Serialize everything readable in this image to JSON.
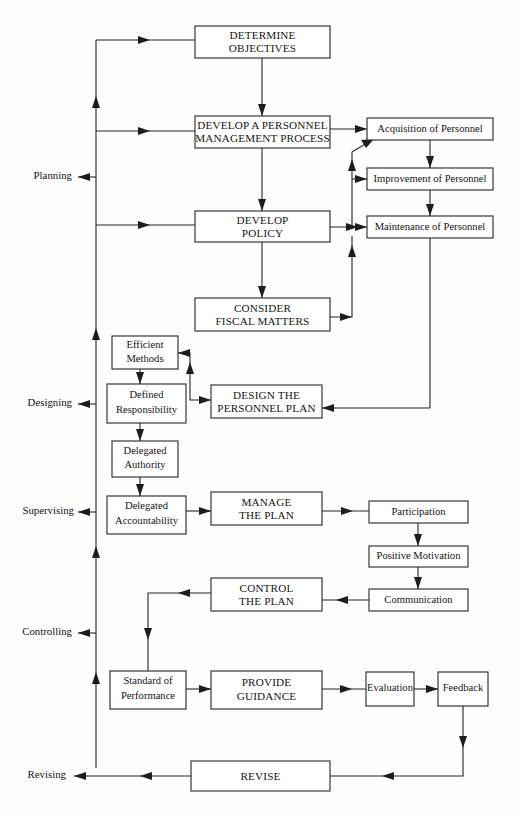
{
  "diagram": {
    "colors": {
      "background": "#fdfdfc",
      "line": "#262626",
      "box_fill": "#ffffff",
      "text": "#141414"
    },
    "phase_labels": [
      {
        "id": "planning",
        "text": "Planning"
      },
      {
        "id": "designing",
        "text": "Designing"
      },
      {
        "id": "supervising",
        "text": "Supervising"
      },
      {
        "id": "controlling",
        "text": "Controlling"
      },
      {
        "id": "revising",
        "text": "Revising"
      }
    ],
    "boxes": [
      {
        "id": "determine-objectives",
        "line1": "DETERMINE",
        "line2": "OBJECTIVES",
        "style": "caps"
      },
      {
        "id": "develop-personnel-management-process",
        "line1": "DEVELOP A PERSONNEL",
        "line2": "MANAGEMENT PROCESS",
        "style": "caps"
      },
      {
        "id": "develop-policy",
        "line1": "DEVELOP",
        "line2": "POLICY",
        "style": "caps"
      },
      {
        "id": "consider-fiscal-matters",
        "line1": "CONSIDER",
        "line2": "FISCAL MATTERS",
        "style": "caps"
      },
      {
        "id": "acquisition-of-personnel",
        "line1": "Acquisition of Personnel",
        "line2": "",
        "style": "small"
      },
      {
        "id": "improvement-of-personnel",
        "line1": "Improvement of Personnel",
        "line2": "",
        "style": "small"
      },
      {
        "id": "maintenance-of-personnel",
        "line1": "Maintenance of Personnel",
        "line2": "",
        "style": "small"
      },
      {
        "id": "efficient-methods",
        "line1": "Efficient",
        "line2": "Methods",
        "style": "small"
      },
      {
        "id": "defined-responsibility",
        "line1": "Defined",
        "line2": "Responsibility",
        "style": "small"
      },
      {
        "id": "delegated-authority",
        "line1": "Delegated",
        "line2": "Authority",
        "style": "small"
      },
      {
        "id": "delegated-accountability",
        "line1": "Delegated",
        "line2": "Accountability",
        "style": "small"
      },
      {
        "id": "design-the-personnel-plan",
        "line1": "DESIGN THE",
        "line2": "PERSONNEL PLAN",
        "style": "caps"
      },
      {
        "id": "manage-the-plan",
        "line1": "MANAGE",
        "line2": "THE PLAN",
        "style": "caps"
      },
      {
        "id": "participation",
        "line1": "Participation",
        "line2": "",
        "style": "small"
      },
      {
        "id": "positive-motivation",
        "line1": "Positive Motivation",
        "line2": "",
        "style": "small"
      },
      {
        "id": "communication",
        "line1": "Communication",
        "line2": "",
        "style": "small"
      },
      {
        "id": "control-the-plan",
        "line1": "CONTROL",
        "line2": "THE PLAN",
        "style": "caps"
      },
      {
        "id": "standard-of-performance",
        "line1": "Standard of",
        "line2": "Performance",
        "style": "small"
      },
      {
        "id": "provide-guidance",
        "line1": "PROVIDE",
        "line2": "GUIDANCE",
        "style": "caps"
      },
      {
        "id": "evaluation",
        "line1": "Evaluation",
        "line2": "",
        "style": "small"
      },
      {
        "id": "feedback",
        "line1": "Feedback",
        "line2": "",
        "style": "small"
      },
      {
        "id": "revise",
        "line1": "REVISE",
        "line2": "",
        "style": "caps"
      }
    ]
  }
}
